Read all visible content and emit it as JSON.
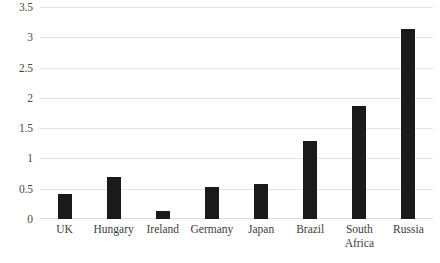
{
  "chart_data": {
    "type": "bar",
    "title": "",
    "subtitle": "",
    "xlabel": "",
    "ylabel": "",
    "categories": [
      "UK",
      "Hungary",
      "Ireland",
      "Germany",
      "Japan",
      "Brazil",
      "South Africa",
      "Russia"
    ],
    "values": [
      0.42,
      0.7,
      0.14,
      0.53,
      0.57,
      1.29,
      1.86,
      3.14
    ],
    "series": [
      {
        "name": "",
        "values": [
          0.42,
          0.7,
          0.14,
          0.53,
          0.57,
          1.29,
          1.86,
          3.14
        ]
      }
    ],
    "ylim": [
      0,
      3.5
    ],
    "yticks": [
      0,
      0.5,
      1,
      1.5,
      2,
      2.5,
      3,
      3.5
    ],
    "ytick_labels": [
      "0",
      "0.5",
      "1",
      "1.5",
      "2",
      "2.5",
      "3",
      "3.5"
    ],
    "grid": true,
    "grid_axis": "y",
    "legend": false,
    "legend_position": "none",
    "bar_color": "#1a1a1a",
    "grid_color": "#e4e4e4",
    "axis_text_color": "#4a4a4a",
    "background_color": "#ffffff"
  }
}
